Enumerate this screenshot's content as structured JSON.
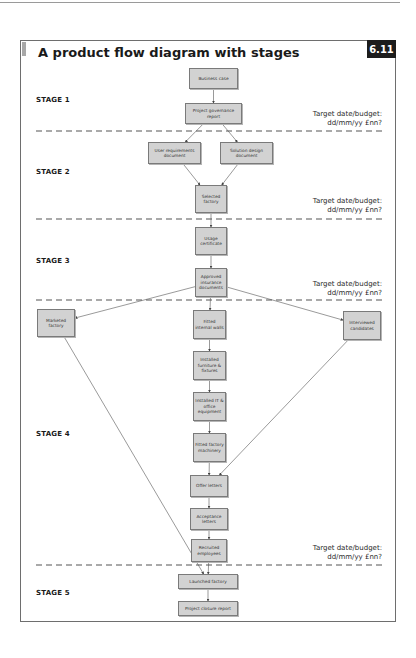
{
  "figure": {
    "title": "A product flow diagram with stages",
    "number": "6.11"
  },
  "stages": [
    {
      "label": "STAGE 1"
    },
    {
      "label": "STAGE 2"
    },
    {
      "label": "STAGE 3"
    },
    {
      "label": "STAGE 4"
    },
    {
      "label": "STAGE 5"
    }
  ],
  "targets": [
    {
      "line1": "Target date/budget:",
      "line2": "dd/mm/yy £nn?"
    },
    {
      "line1": "Target date/budget:",
      "line2": "dd/mm/yy £nn?"
    },
    {
      "line1": "Target date/budget:",
      "line2": "dd/mm/yy £nn?"
    },
    {
      "line1": "Target date/budget:",
      "line2": "dd/mm/yy £nn?"
    }
  ],
  "nodes": {
    "business_case": "Business case",
    "project_governance_report": "Project governance report",
    "user_requirements_document": "User requirements document",
    "solution_design_document": "Solution design document",
    "selected_factory": "Selected factory",
    "usage_certificate": "Usage certificate",
    "approved_insurance_documents": "Approved insurance documents",
    "marketed_factory": "Marketed factory",
    "fitted_internal_walls": "Fitted internal walls",
    "interviewed_candidates": "Interviewed candidates",
    "installed_furniture_fixtures": "Installed furniture & fixtures",
    "installed_it_office_equipment": "Installed IT & office equipment",
    "fitted_factory_machinery": "Fitted factory machinery",
    "offer_letters": "Offer letters",
    "acceptance_letters": "Acceptance letters",
    "recruited_employees": "Recruited employees",
    "launched_factory": "Launched factory",
    "project_closure_report": "Project closure report"
  },
  "edges": [
    [
      "business_case",
      "project_governance_report"
    ],
    [
      "project_governance_report",
      "user_requirements_document"
    ],
    [
      "project_governance_report",
      "solution_design_document"
    ],
    [
      "user_requirements_document",
      "selected_factory"
    ],
    [
      "solution_design_document",
      "selected_factory"
    ],
    [
      "selected_factory",
      "usage_certificate"
    ],
    [
      "usage_certificate",
      "approved_insurance_documents"
    ],
    [
      "approved_insurance_documents",
      "marketed_factory"
    ],
    [
      "approved_insurance_documents",
      "fitted_internal_walls"
    ],
    [
      "approved_insurance_documents",
      "interviewed_candidates"
    ],
    [
      "fitted_internal_walls",
      "installed_furniture_fixtures"
    ],
    [
      "installed_furniture_fixtures",
      "installed_it_office_equipment"
    ],
    [
      "installed_it_office_equipment",
      "fitted_factory_machinery"
    ],
    [
      "fitted_factory_machinery",
      "offer_letters"
    ],
    [
      "interviewed_candidates",
      "offer_letters"
    ],
    [
      "offer_letters",
      "acceptance_letters"
    ],
    [
      "acceptance_letters",
      "recruited_employees"
    ],
    [
      "recruited_employees",
      "launched_factory"
    ],
    [
      "marketed_factory",
      "launched_factory"
    ],
    [
      "launched_factory",
      "project_closure_report"
    ]
  ]
}
